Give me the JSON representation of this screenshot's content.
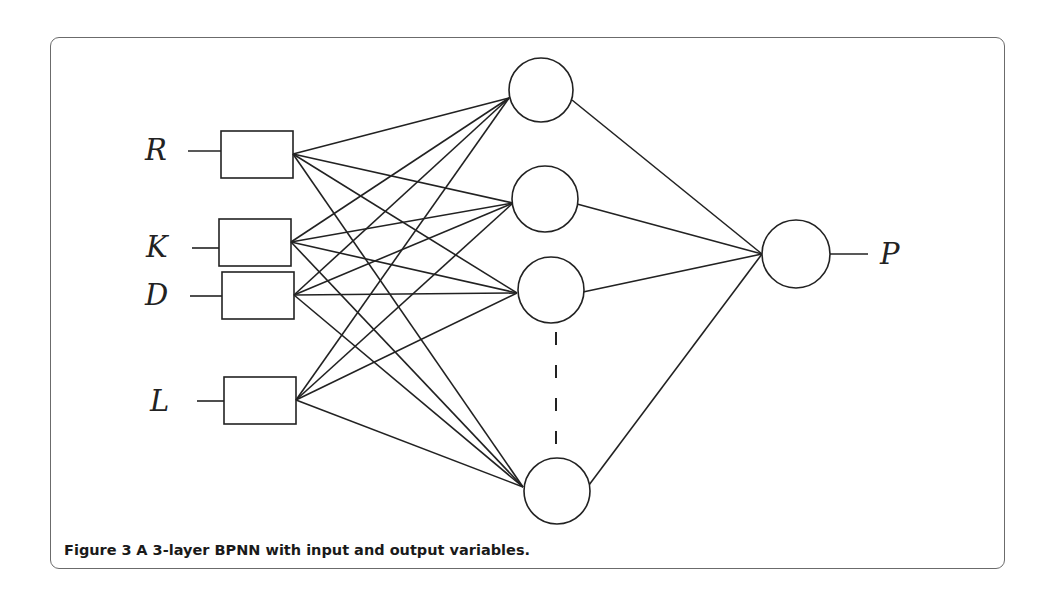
{
  "figure": {
    "caption": {
      "number": "Figure 3",
      "text": "A 3-layer BPNN with input and output variables."
    },
    "title": "3-layer BPNN"
  },
  "network": {
    "input_layer": {
      "nodes": [
        {
          "id": "R",
          "label": "R"
        },
        {
          "id": "K",
          "label": "K"
        },
        {
          "id": "D",
          "label": "D"
        },
        {
          "id": "L",
          "label": "L"
        }
      ]
    },
    "hidden_layer": {
      "visible_nodes": 4,
      "ellipsis": "dashed line between 3rd and last hidden node"
    },
    "output_layer": {
      "nodes": [
        {
          "id": "P",
          "label": "P"
        }
      ]
    },
    "connectivity": "fully connected: each input to each hidden node; each hidden node to output"
  },
  "colors": {
    "line": "#222222",
    "frame_border": "#6b6b6b",
    "background": "#ffffff"
  }
}
